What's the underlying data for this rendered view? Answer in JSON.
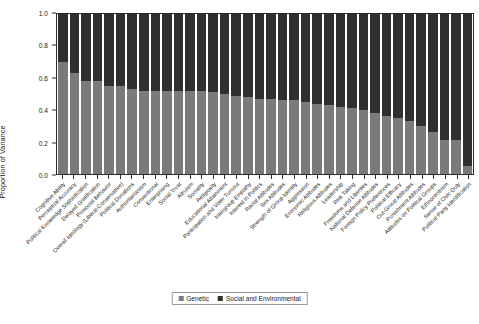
{
  "chart_data": {
    "type": "bar",
    "subtype": "stacked-bar-100-percent",
    "title": "",
    "xlabel": "",
    "ylabel": "Proportion of Variance",
    "ylim": [
      0.0,
      1.0
    ],
    "yticks": [
      "0.0",
      "0.2",
      "0.4",
      "0.6",
      "0.8",
      "1.0"
    ],
    "ytick_values": [
      0.0,
      0.2,
      0.4,
      0.6,
      0.8,
      1.0
    ],
    "grid": false,
    "legend_position": "bottom-center",
    "categories": [
      "Cognitive Ability",
      "Perceptual Accuracy",
      "Political Knowledge Sophistication",
      "Delayed Gratification",
      "Prosocial Behavior",
      "Overall Ideology (Liberal-Conservative)",
      "Political Donations",
      "Authoritarianism",
      "Conventional",
      "Enterprising",
      "Social Trust",
      "Altruism",
      "Sociality",
      "Religiosity",
      "Educational Attainment",
      "Participation and Voter Turnout",
      "Intergroup Empathy",
      "Interest in Politics",
      "Racial Attitudes",
      "Sex Attitudes",
      "Strength of Group Identity",
      "Aggression",
      "Economic Attitudes",
      "Religious Attitudes",
      "Leadership",
      "Risk Taking",
      "Freedoms and Liberties",
      "National Defense Attitudes",
      "Foreign Policy Preferences",
      "Political Efficacy",
      "Out-Group Attitudes",
      "Punishment Attitudes",
      "Attitudes on Political Groups",
      "Ethnocentrism",
      "Sense of Civic Duty",
      "Political Party Identification"
    ],
    "series": [
      {
        "name": "Genetic",
        "color": "#7a7a7a",
        "values": [
          0.7,
          0.63,
          0.58,
          0.58,
          0.55,
          0.55,
          0.53,
          0.52,
          0.52,
          0.52,
          0.52,
          0.52,
          0.52,
          0.51,
          0.5,
          0.49,
          0.48,
          0.47,
          0.47,
          0.46,
          0.46,
          0.45,
          0.44,
          0.43,
          0.42,
          0.41,
          0.4,
          0.38,
          0.36,
          0.35,
          0.33,
          0.3,
          0.26,
          0.21,
          0.21,
          0.05
        ]
      },
      {
        "name": "Social and Environmental",
        "color": "#2f2f2f",
        "values": [
          0.3,
          0.37,
          0.42,
          0.42,
          0.45,
          0.45,
          0.47,
          0.48,
          0.48,
          0.48,
          0.48,
          0.48,
          0.48,
          0.49,
          0.5,
          0.51,
          0.52,
          0.53,
          0.53,
          0.54,
          0.54,
          0.55,
          0.56,
          0.57,
          0.58,
          0.59,
          0.6,
          0.62,
          0.64,
          0.65,
          0.67,
          0.7,
          0.74,
          0.79,
          0.79,
          0.95
        ]
      }
    ]
  },
  "legend": {
    "items": [
      {
        "label": "Genetic"
      },
      {
        "label": "Social and Environmental"
      }
    ]
  }
}
